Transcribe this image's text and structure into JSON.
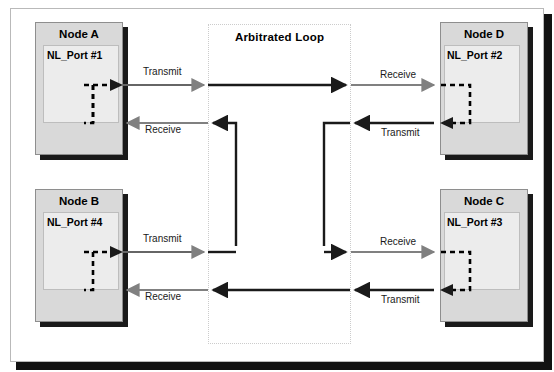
{
  "diagram": {
    "loop_title": "Arbitrated Loop",
    "colors": {
      "node_fill": "#d9d9d9",
      "port_fill": "#ececec",
      "wire_black": "#1a1a1a",
      "wire_gray": "#808080",
      "frame_border": "#b9b9b9",
      "loop_border": "#cccccc"
    },
    "nodes": [
      {
        "id": "node-a",
        "title": "Node A",
        "port": "NL_Port #1",
        "position": "top-left"
      },
      {
        "id": "node-d",
        "title": "Node D",
        "port": "NL_Port #2",
        "position": "top-right"
      },
      {
        "id": "node-b",
        "title": "Node B",
        "port": "NL_Port #4",
        "position": "bottom-left"
      },
      {
        "id": "node-c",
        "title": "Node C",
        "port": "NL_Port #3",
        "position": "bottom-right"
      }
    ],
    "wire_labels": [
      {
        "id": "a-transmit",
        "text": "Transmit",
        "node": "Node A",
        "x": 143,
        "y": 66
      },
      {
        "id": "d-receive",
        "text": "Receive",
        "node": "Node D",
        "x": 380,
        "y": 69
      },
      {
        "id": "a-receive",
        "text": "Receive",
        "node": "Node A",
        "x": 145,
        "y": 124
      },
      {
        "id": "d-transmit",
        "text": "Transmit",
        "node": "Node D",
        "x": 381,
        "y": 127
      },
      {
        "id": "b-transmit",
        "text": "Transmit",
        "node": "Node B",
        "x": 143,
        "y": 233
      },
      {
        "id": "c-receive",
        "text": "Receive",
        "node": "Node C",
        "x": 380,
        "y": 236
      },
      {
        "id": "b-receive",
        "text": "Receive",
        "node": "Node B",
        "x": 145,
        "y": 291
      },
      {
        "id": "c-transmit",
        "text": "Transmit",
        "node": "Node C",
        "x": 381,
        "y": 294
      }
    ],
    "loop_path_order": [
      "NL_Port #1",
      "NL_Port #2",
      "NL_Port #3",
      "NL_Port #4"
    ]
  }
}
